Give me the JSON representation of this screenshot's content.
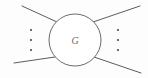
{
  "figure": {
    "type": "feynman-blob-diagram",
    "canvas": {
      "width": 148,
      "height": 78,
      "background": "#fdfdfd"
    },
    "blob": {
      "label": "G",
      "center_x": 75,
      "center_y": 40,
      "radius": 26,
      "stroke_color": "#5a5a5a",
      "fill_color": "#ffffff",
      "label_color": "#6b6b6b"
    },
    "legs": [
      {
        "name": "upper-left-leg",
        "x1": 22,
        "y1": 6,
        "x2": 57,
        "y2": 22
      },
      {
        "name": "lower-left-leg",
        "x1": 14,
        "y1": 63,
        "x2": 55,
        "y2": 57
      },
      {
        "name": "upper-right-leg",
        "x1": 93,
        "y1": 22,
        "x2": 140,
        "y2": 6
      },
      {
        "name": "lower-right-leg",
        "x1": 94,
        "y1": 57,
        "x2": 141,
        "y2": 73
      }
    ],
    "ellipses": [
      {
        "name": "left-ellipsis",
        "x": 31,
        "dot_radius": 1.1,
        "dot_ys": [
          30,
          40,
          50
        ],
        "glyph": "⋮",
        "color": "#4a4a4a"
      },
      {
        "name": "right-ellipsis",
        "x": 118,
        "dot_radius": 1.1,
        "dot_ys": [
          30,
          40,
          50
        ],
        "glyph": "⋮",
        "color": "#4a4a4a"
      }
    ],
    "line_color": "#4a4a4a",
    "line_width": 0.9
  }
}
